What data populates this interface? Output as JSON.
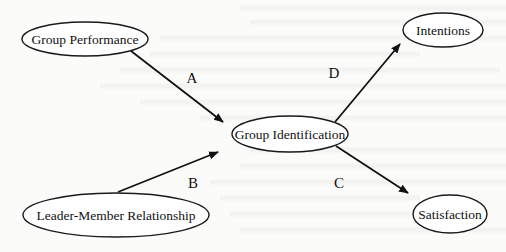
{
  "diagram": {
    "type": "path-model",
    "nodes": [
      {
        "id": "group_performance",
        "label": "Group Performance",
        "cx": 85,
        "cy": 39,
        "rx": 63,
        "ry": 17
      },
      {
        "id": "leader_member",
        "label": "Leader-Member Relationship",
        "cx": 116,
        "cy": 215,
        "rx": 93,
        "ry": 22
      },
      {
        "id": "group_identification",
        "label": "Group Identification",
        "cx": 290,
        "cy": 134,
        "rx": 58,
        "ry": 18
      },
      {
        "id": "intentions",
        "label": "Intentions",
        "cx": 443,
        "cy": 30,
        "rx": 40,
        "ry": 17
      },
      {
        "id": "satisfaction",
        "label": "Satisfaction",
        "cx": 450,
        "cy": 214,
        "rx": 37,
        "ry": 19
      }
    ],
    "edges": [
      {
        "id": "A",
        "label": "A",
        "from": "group_performance",
        "to": "group_identification",
        "x1": 131,
        "y1": 51,
        "x2": 223,
        "y2": 122,
        "lx": 192,
        "ly": 78
      },
      {
        "id": "B",
        "label": "B",
        "from": "leader_member",
        "to": "group_identification",
        "x1": 118,
        "y1": 192,
        "x2": 218,
        "y2": 152,
        "lx": 193,
        "ly": 183
      },
      {
        "id": "D",
        "label": "D",
        "from": "group_identification",
        "to": "intentions",
        "x1": 335,
        "y1": 122,
        "x2": 400,
        "y2": 44,
        "lx": 334,
        "ly": 73
      },
      {
        "id": "C",
        "label": "C",
        "from": "group_identification",
        "to": "satisfaction",
        "x1": 336,
        "y1": 146,
        "x2": 408,
        "y2": 193,
        "lx": 339,
        "ly": 183
      }
    ],
    "colors": {
      "stroke": "#111111",
      "background": "#fbfbfa"
    }
  }
}
